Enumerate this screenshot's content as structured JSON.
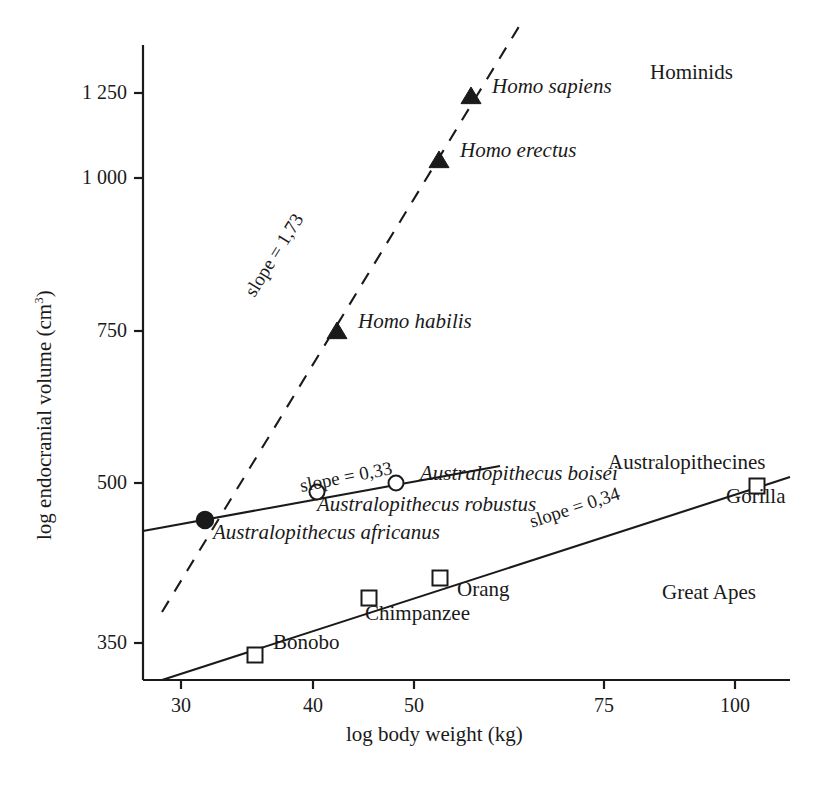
{
  "chart_data": {
    "type": "scatter",
    "title": "",
    "xlabel": "log body weight (kg)",
    "ylabel_text": "log endocranial volume (cm",
    "ylabel_sup": "3",
    "ylabel_close": ")",
    "ylabel_full": "log endocranial volume (cm3)",
    "grid": false,
    "legend_position": "none",
    "xlim": [
      26,
      110
    ],
    "ylim": [
      310,
      1400
    ],
    "x_ticks": [
      {
        "label": "30",
        "value": 30,
        "px": 181
      },
      {
        "label": "40",
        "value": 40,
        "px": 313
      },
      {
        "label": "50",
        "value": 50,
        "px": 414
      },
      {
        "label": "75",
        "value": 75,
        "px": 604
      },
      {
        "label": "100",
        "value": 100,
        "px": 735
      }
    ],
    "y_ticks": [
      {
        "label": "1 250",
        "value": 1250,
        "px": 93
      },
      {
        "label": "1 000",
        "value": 1000,
        "px": 178
      },
      {
        "label": "750",
        "value": 750,
        "px": 331
      },
      {
        "label": "500",
        "value": 500,
        "px": 483
      },
      {
        "label": "350",
        "value": 350,
        "px": 643
      }
    ],
    "group_labels": [
      {
        "name": "Hominids",
        "x": 650,
        "y": 62
      },
      {
        "name": "Australopithecines",
        "x": 608,
        "y": 452
      },
      {
        "name": "Great Apes",
        "x": 662,
        "y": 582
      }
    ],
    "series": [
      {
        "name": "Hominids",
        "marker": "filled-triangle",
        "trendline": {
          "style": "dashed",
          "slope_label": "slope = 1,73",
          "x1": 162,
          "y1": 612,
          "x2": 523,
          "y2": 20,
          "label_x": 249,
          "label_y": 285,
          "label_angle": -58
        },
        "points": [
          {
            "label": "Homo sapiens",
            "body_weight": 57,
            "endocranial_volume": 1230,
            "px": 471,
            "py": 96,
            "lx": 492,
            "ly": 87
          },
          {
            "label": "Homo erectus",
            "body_weight": 54.5,
            "endocranial_volume": 1050,
            "px": 439,
            "py": 160,
            "lx": 460,
            "ly": 151
          },
          {
            "label": "Homo habilis",
            "body_weight": 43.5,
            "endocranial_volume": 742,
            "px": 337,
            "py": 331,
            "lx": 358,
            "ly": 322
          }
        ]
      },
      {
        "name": "Australopithecines",
        "marker": "open-circle",
        "trendline": {
          "style": "solid",
          "slope_label": "slope = 0,33",
          "x1": 143,
          "y1": 531,
          "x2": 500,
          "y2": 466,
          "label_x": 300,
          "label_y": 476,
          "label_angle": -11
        },
        "points": [
          {
            "label": "Australopithecus boisei",
            "body_weight": 47.5,
            "endocranial_volume": 512,
            "px": 396,
            "py": 483,
            "lx": 420,
            "ly": 474
          },
          {
            "label": "Australopithecus robustus",
            "body_weight": 41,
            "endocranial_volume": 495,
            "px": 317,
            "py": 492,
            "lx": 317,
            "ly": 505
          },
          {
            "label": "Australopithecus africanus",
            "body_weight": 33.5,
            "endocranial_volume": 432,
            "px": 205,
            "py": 520,
            "lx": 213,
            "ly": 533
          }
        ]
      },
      {
        "name": "Great Apes",
        "marker": "open-square",
        "trendline": {
          "style": "solid",
          "slope_label": "slope = 0,34",
          "x1": 162,
          "y1": 680,
          "x2": 790,
          "y2": 477,
          "label_x": 530,
          "label_y": 512,
          "label_angle": -18
        },
        "points": [
          {
            "label": "Gorilla",
            "body_weight": 103.5,
            "endocranial_volume": 505,
            "px": 757,
            "py": 486,
            "lx": 726,
            "ly": 497
          },
          {
            "label": "Orang",
            "body_weight": 53,
            "endocranial_volume": 400,
            "px": 440,
            "py": 578,
            "lx": 457,
            "ly": 590
          },
          {
            "label": "Chimpanzee",
            "body_weight": 47,
            "endocranial_volume": 383,
            "px": 369,
            "py": 598,
            "lx": 365,
            "ly": 614
          },
          {
            "label": "Bonobo",
            "body_weight": 38,
            "endocranial_volume": 342,
            "px": 255,
            "py": 655,
            "lx": 273,
            "ly": 643
          }
        ]
      }
    ],
    "axes_geometry": {
      "x_axis_y": 680,
      "x_axis_x1": 143,
      "x_axis_x2": 790,
      "y_axis_x": 143,
      "y_axis_y1": 45,
      "y_axis_y2": 680,
      "tick_len": 9
    },
    "colors": {
      "ink": "#1a1a1a",
      "background": "#ffffff"
    }
  }
}
